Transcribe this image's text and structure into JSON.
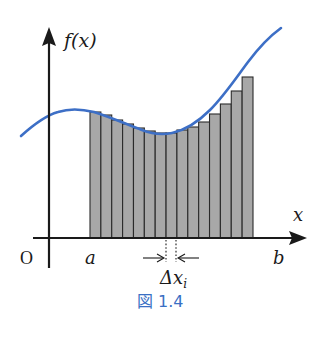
{
  "figure": {
    "caption": "図 1.4",
    "caption_color": "#3a6fc4",
    "labels": {
      "y_axis": "f(x)",
      "x_axis": "x",
      "origin": "O",
      "a": "a",
      "b": "b",
      "delta_x": "Δx",
      "delta_sub": "i"
    },
    "colors": {
      "curve": "#3d6fc6",
      "bar_fill": "#a8a8a8",
      "bar_stroke": "#2a2a2a",
      "axis": "#1a1a1a"
    }
  },
  "chart_data": {
    "type": "area",
    "xlabel": "x",
    "ylabel": "f(x)",
    "annotations": [
      "O",
      "a",
      "b",
      "Δx_i",
      "図 1.4"
    ],
    "bar_count": 15,
    "bar_heights_relative": [
      126,
      123,
      118,
      114,
      110,
      107,
      105,
      105,
      108,
      111,
      116,
      124,
      134,
      147,
      161
    ],
    "grid": false
  }
}
